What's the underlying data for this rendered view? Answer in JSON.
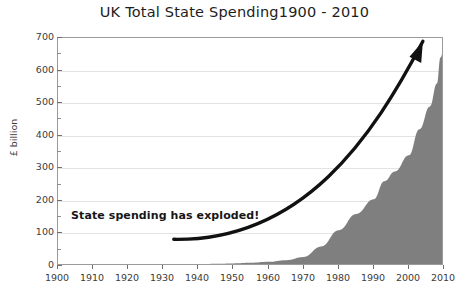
{
  "chart": {
    "title": "UK Total State Spending1900 - 2010",
    "ylabel": "£ billion",
    "annotation": "State spending has exploded!",
    "fill_color": "#7f7f7f",
    "grid_color": "#e3e3e3",
    "arrow_color": "#111111"
  },
  "chart_data": {
    "type": "area",
    "title": "UK Total State Spending1900 - 2010",
    "xlabel": "",
    "ylabel": "£ billion",
    "xlim": [
      1900,
      2010
    ],
    "ylim": [
      0,
      700
    ],
    "grid": true,
    "legend": null,
    "ytick_labels": [
      "0",
      "100",
      "200",
      "300",
      "400",
      "500",
      "600",
      "700"
    ],
    "ytick_values": [
      0,
      100,
      200,
      300,
      400,
      500,
      600,
      700
    ],
    "yminor_values": [
      50,
      150,
      250,
      350,
      450,
      550,
      650
    ],
    "xtick_labels": [
      "1900",
      "1910",
      "1920",
      "1930",
      "1940",
      "1950",
      "1960",
      "1970",
      "1980",
      "1990",
      "2000",
      "2010"
    ],
    "xtick_values": [
      1900,
      1910,
      1920,
      1930,
      1940,
      1950,
      1960,
      1970,
      1980,
      1990,
      2000,
      2010
    ],
    "x": [
      1900,
      1905,
      1910,
      1915,
      1920,
      1925,
      1930,
      1935,
      1940,
      1945,
      1950,
      1955,
      1960,
      1965,
      1970,
      1975,
      1980,
      1985,
      1990,
      1993,
      1996,
      2000,
      2003,
      2006,
      2008,
      2009,
      2010
    ],
    "values": [
      1,
      1,
      1,
      3,
      3,
      2,
      2,
      3,
      5,
      7,
      8,
      10,
      13,
      18,
      28,
      60,
      110,
      160,
      205,
      260,
      290,
      340,
      420,
      490,
      560,
      640,
      672
    ],
    "annotations": [
      {
        "text": "State spending has exploded!",
        "x": 1906,
        "y": 120,
        "bold": true
      },
      {
        "type": "arrow",
        "start": [
          1933,
          82
        ],
        "end": [
          2004,
          690
        ],
        "color": "#111111"
      }
    ]
  }
}
